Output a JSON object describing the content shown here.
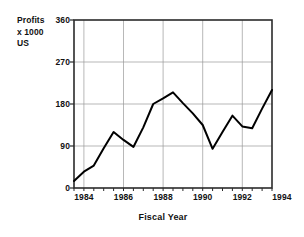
{
  "chart_data": {
    "type": "line",
    "title": "",
    "xlabel": "Fiscal Year",
    "ylabel": "Profits x 1000 US",
    "ylabel_lines": [
      "Profits",
      "x 1000",
      "US"
    ],
    "xlim": [
      1983.5,
      1993.5
    ],
    "ylim": [
      0,
      360
    ],
    "yticks": [
      0,
      90,
      180,
      270,
      360
    ],
    "ytick_labels": [
      "0",
      "90",
      "180",
      "270",
      "360"
    ],
    "xticks": [
      1984,
      1986,
      1988,
      1990,
      1992,
      1994
    ],
    "xtick_labels": [
      "1984",
      "1986",
      "1988",
      "1990",
      "1992",
      "1994"
    ],
    "grid": true,
    "grid_axis": "both",
    "legend": false,
    "legend_position": "none",
    "line_color": "#000000",
    "series": [
      {
        "name": "Profits",
        "x": [
          1983.5,
          1984.0,
          1984.5,
          1985.0,
          1985.5,
          1986.0,
          1986.5,
          1987.0,
          1987.5,
          1988.0,
          1988.5,
          1989.0,
          1989.5,
          1990.0,
          1990.5,
          1991.0,
          1991.5,
          1992.0,
          1992.5,
          1993.0,
          1993.5
        ],
        "values": [
          15,
          35,
          48,
          85,
          120,
          103,
          88,
          130,
          180,
          192,
          205,
          182,
          160,
          135,
          84,
          120,
          155,
          132,
          128,
          170,
          210
        ]
      }
    ]
  },
  "axis": {
    "ylabel_lines": [
      "Profits",
      "x 1000",
      "US"
    ],
    "xtitle": "Fiscal Year"
  }
}
